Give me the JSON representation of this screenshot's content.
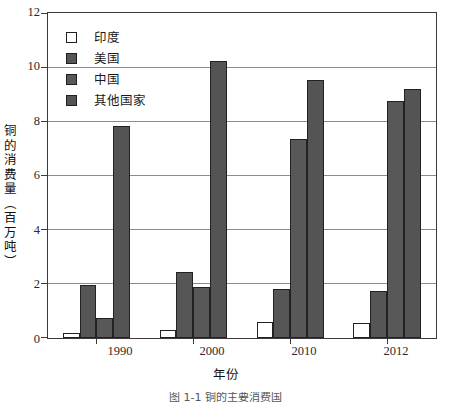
{
  "chart_data": {
    "type": "bar",
    "title": "",
    "xlabel": "年份",
    "ylabel": "铜的消费量（百万吨）",
    "categories": [
      "1990",
      "2000",
      "2010",
      "2012"
    ],
    "series": [
      {
        "name": "印度",
        "color": "#ffffff",
        "values": [
          0.2,
          0.3,
          0.6,
          0.55
        ]
      },
      {
        "name": "美国",
        "color": "#565656",
        "values": [
          1.95,
          2.45,
          1.8,
          1.75
        ]
      },
      {
        "name": "中国",
        "color": "#585858",
        "values": [
          0.75,
          1.9,
          7.35,
          8.75
        ]
      },
      {
        "name": "其他国家",
        "color": "#545454",
        "values": [
          7.85,
          10.25,
          9.55,
          9.2
        ]
      }
    ],
    "ylim": [
      0,
      12
    ],
    "yticks": [
      0,
      2,
      4,
      6,
      8,
      10,
      12
    ],
    "ytick_labels": [
      "0",
      "2",
      "4",
      "6",
      "8",
      "10",
      "12"
    ],
    "grid": true,
    "grid_axis": "y",
    "legend_position": "top-left-inside",
    "frame": true
  },
  "legend": {
    "items": [
      {
        "label": "印度",
        "swatch": "white-square-swatch"
      },
      {
        "label": "美国",
        "swatch": "dark-gray-square-swatch"
      },
      {
        "label": "中国",
        "swatch": "dark-gray-square-swatch"
      },
      {
        "label": "其他国家",
        "swatch": "dark-gray-square-swatch"
      }
    ]
  },
  "axes": {
    "y_title": "铜的消费量（百万吨）",
    "x_title": "年份"
  },
  "caption": "图 1-1  铜的主要消费国"
}
